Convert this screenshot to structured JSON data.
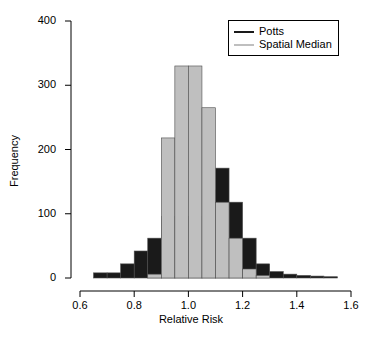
{
  "chart_data": {
    "type": "bar",
    "subtype": "overlaid-histogram",
    "title": "",
    "xlabel": "Relative Risk",
    "ylabel": "Frequency",
    "xlim": [
      0.6,
      1.6
    ],
    "ylim": [
      0,
      400
    ],
    "xticks": [
      "0.6",
      "0.8",
      "1.0",
      "1.2",
      "1.4",
      "1.6"
    ],
    "xtick_values": [
      0.6,
      0.8,
      1.0,
      1.2,
      1.4,
      1.6
    ],
    "yticks": [
      "0",
      "100",
      "200",
      "300",
      "400"
    ],
    "ytick_values": [
      0,
      100,
      200,
      300,
      400
    ],
    "grid": false,
    "bin_width": 0.05,
    "legend_position": "top-right",
    "colors": {
      "potts": "#1a1a1a",
      "spatial_median": "#bfbfbf",
      "axis": "#000000",
      "background": "#ffffff"
    },
    "bin_starts": [
      0.65,
      0.7,
      0.75,
      0.8,
      0.85,
      0.9,
      0.95,
      1.0,
      1.05,
      1.1,
      1.15,
      1.2,
      1.25,
      1.3,
      1.35,
      1.4,
      1.45,
      1.5
    ],
    "series": [
      {
        "name": "Potts",
        "color": "#1a1a1a",
        "values": [
          8,
          8,
          22,
          42,
          62,
          96,
          96,
          96,
          137,
          171,
          118,
          62,
          22,
          10,
          6,
          4,
          3,
          2
        ]
      },
      {
        "name": "Spatial Median",
        "color": "#bfbfbf",
        "values": [
          0,
          0,
          0,
          0,
          6,
          218,
          330,
          330,
          265,
          118,
          62,
          14,
          4,
          0,
          0,
          0,
          0,
          0
        ]
      }
    ]
  },
  "legend": {
    "entries": [
      {
        "label": "Potts",
        "color": "#1a1a1a"
      },
      {
        "label": "Spatial Median",
        "color": "#bfbfbf"
      }
    ]
  }
}
